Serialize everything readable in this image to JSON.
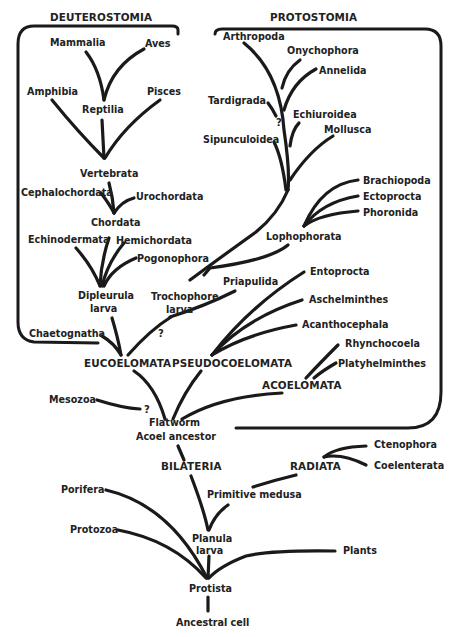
{
  "diagram": {
    "type": "phylogenetic-tree",
    "ink_color": "#1a1a1a",
    "background": "#ffffff",
    "groups": {
      "deuterostomia": "DEUTEROSTOMIA",
      "protostomia": "PROTOSTOMIA",
      "eucoelomata": "EUCOELOMATA",
      "pseudocoelomata": "PSEUDOCOELOMATA",
      "acoelomata": "ACOELOMATA",
      "bilateria": "BILATERIA",
      "radiata": "RADIATA"
    },
    "taxa": {
      "mammalia": "Mammalia",
      "aves": "Aves",
      "amphibia": "Amphibia",
      "pisces": "Pisces",
      "reptilia": "Reptilia",
      "vertebrata": "Vertebrata",
      "cephalochordata": "Cephalochordata",
      "urochordata": "Urochordata",
      "chordata": "Chordata",
      "echinodermata": "Echinodermata",
      "hemichordata": "Hemichordata",
      "pogonophora": "Pogonophora",
      "dipleurula_1": "Dipleurula",
      "dipleurula_2": "larva",
      "chaetognatha": "Chaetognatha",
      "arthropoda": "Arthropoda",
      "onychophora": "Onychophora",
      "annelida": "Annelida",
      "tardigrada": "Tardigrada",
      "echiuroidea": "Echiuroidea",
      "sipunculoidea": "Sipunculoidea",
      "mollusca": "Mollusca",
      "brachiopoda": "Brachiopoda",
      "ectoprocta": "Ectoprocta",
      "phoronida": "Phoronida",
      "lophophorata": "Lophophorata",
      "trochophore_1": "Trochophore",
      "trochophore_2": "larva",
      "priapulida": "Priapulida",
      "entoprocta": "Entoprocta",
      "aschelminthes": "Aschelminthes",
      "acanthocephala": "Acanthocephala",
      "rhynchocoela": "Rhynchocoela",
      "platyhelminthes": "Platyhelminthes",
      "mesozoa": "Mesozoa",
      "flatworm_1": "Flatworm",
      "flatworm_2": "Acoel ancestor",
      "ctenophora": "Ctenophora",
      "coelenterata": "Coelenterata",
      "primitive_medusa": "Primitive medusa",
      "porifera": "Porifera",
      "protozoa": "Protozoa",
      "planula_1": "Planula",
      "planula_2": "larva",
      "plants": "Plants",
      "protista": "Protista",
      "ancestral_cell": "Ancestral cell"
    },
    "uncertain_marks": {
      "tardigrada": "?",
      "trochophore": "?",
      "mesozoa": "?"
    }
  }
}
